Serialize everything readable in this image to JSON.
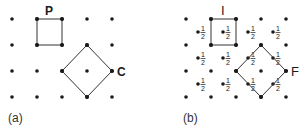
{
  "panels": [
    {
      "caption": "(a)",
      "grid": {
        "cols_x": [
          12,
          37,
          62,
          87,
          112
        ],
        "rows_y": [
          19,
          45,
          71,
          97
        ]
      },
      "square": {
        "label": "P",
        "points": "37,19 62,19 62,45 37,45"
      },
      "diamond": {
        "label": "C",
        "points": "87,45 112,71 87,97 62,71"
      }
    },
    {
      "caption": "(b)",
      "grid": {
        "cols_x": [
          186,
          211,
          236,
          261,
          286
        ],
        "rows_y": [
          19,
          45,
          71,
          97
        ]
      },
      "half_points": {
        "label_num": "1",
        "label_den": "2",
        "positions": [
          [
            198,
            32
          ],
          [
            223,
            32
          ],
          [
            248,
            32
          ],
          [
            273,
            32
          ],
          [
            198,
            58
          ],
          [
            223,
            58
          ],
          [
            248,
            58
          ],
          [
            273,
            58
          ],
          [
            198,
            84
          ],
          [
            223,
            84
          ],
          [
            248,
            84
          ],
          [
            273,
            84
          ]
        ]
      },
      "square": {
        "label": "I",
        "points": "211,19 236,19 236,45 211,45"
      },
      "diamond": {
        "label": "F",
        "points": "261,45 286,71 261,97 236,71"
      }
    }
  ]
}
